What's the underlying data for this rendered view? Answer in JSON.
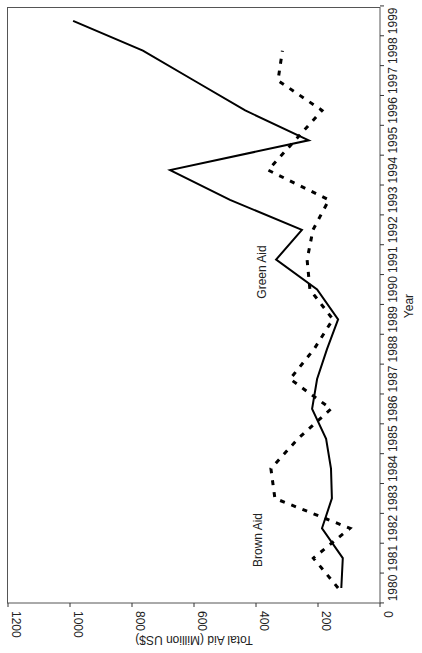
{
  "chart_data": {
    "type": "line",
    "orientation": "rotated-90-ccw",
    "title": "",
    "xlabel": "Year",
    "ylabel": "Total Aid (Million US$)",
    "ylim": [
      0,
      1200
    ],
    "yticks": [
      0,
      200,
      400,
      600,
      800,
      1000,
      1200
    ],
    "grid": false,
    "legend": "inline labels",
    "x": [
      1980,
      1981,
      1982,
      1983,
      1984,
      1985,
      1986,
      1987,
      1988,
      1989,
      1990,
      1991,
      1992,
      1993,
      1994,
      1995,
      1996,
      1997,
      1998,
      1999
    ],
    "series": [
      {
        "name": "Green Aid",
        "style": "solid",
        "color": "#000000",
        "values": [
          125,
          120,
          187,
          155,
          158,
          174,
          219,
          203,
          171,
          135,
          203,
          335,
          252,
          484,
          677,
          230,
          435,
          600,
          765,
          990
        ]
      },
      {
        "name": "Brown Aid",
        "style": "dashed",
        "color": "#000000",
        "values": [
          135,
          215,
          97,
          339,
          352,
          265,
          158,
          290,
          213,
          152,
          226,
          235,
          216,
          165,
          361,
          274,
          187,
          329,
          315,
          null
        ]
      }
    ],
    "annotations": [
      {
        "text": "Green Aid",
        "near_year": 1990,
        "near_value": 385
      },
      {
        "text": "Brown Aid",
        "near_year": 1981.5,
        "near_value": 400
      }
    ]
  }
}
